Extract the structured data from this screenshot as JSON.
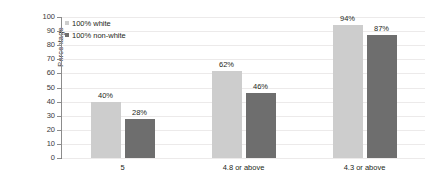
{
  "chart_data": {
    "type": "bar",
    "title": "",
    "subtitle": "",
    "xlabel": "",
    "ylabel": "Percentage",
    "ylim": [
      0,
      100
    ],
    "ytick_step": 10,
    "yticks": [
      0,
      10,
      20,
      30,
      40,
      50,
      60,
      70,
      80,
      90,
      100
    ],
    "grid": true,
    "legend_position": "top-left",
    "categories": [
      "5",
      "4.8 or above",
      "4.3 or above"
    ],
    "series": [
      {
        "name": "100% white",
        "color": "#cdcdcd",
        "values": [
          40,
          62,
          94
        ],
        "labels": [
          "40%",
          "62%",
          "94%"
        ]
      },
      {
        "name": "100% non-white",
        "color": "#6e6e6e",
        "values": [
          28,
          46,
          87
        ],
        "labels": [
          "28%",
          "46%",
          "87%"
        ]
      }
    ]
  },
  "axis": {
    "y_title": "Percentage",
    "y_tick_labels": [
      "100",
      "90",
      "80",
      "70",
      "60",
      "50",
      "40",
      "30",
      "20",
      "10",
      "0"
    ]
  },
  "legend": {
    "items": [
      {
        "label": "100% white",
        "color": "#cdcdcd"
      },
      {
        "label": "100% non-white",
        "color": "#6e6e6e"
      }
    ]
  },
  "colors": {
    "series_light": "#cdcdcd",
    "series_dark": "#6e6e6e",
    "gridline": "#eceaea",
    "axis": "#7d7d7d",
    "text": "#231f20",
    "background": "#ffffff"
  }
}
